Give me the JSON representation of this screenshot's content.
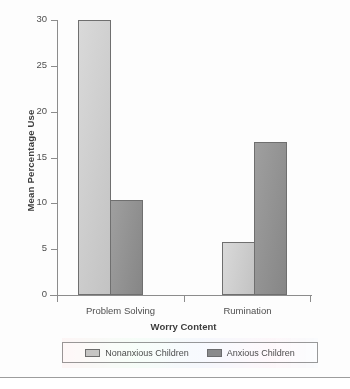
{
  "chart_data": {
    "type": "bar",
    "title": "",
    "xlabel": "Worry Content",
    "ylabel": "Mean Percentage Use",
    "categories": [
      "Problem Solving",
      "Rumination"
    ],
    "series": [
      {
        "name": "Nonanxious Children",
        "values": [
          30.0,
          5.8
        ],
        "color": "#c9c9c9"
      },
      {
        "name": "Anxious Children",
        "values": [
          10.4,
          16.7
        ],
        "color": "#8d8d8d"
      }
    ],
    "ylim": [
      0,
      30
    ],
    "yticks": [
      0,
      5,
      10,
      15,
      20,
      25,
      30
    ],
    "ytick_labels": [
      "0",
      "5",
      "10",
      "15",
      "20",
      "25",
      "30"
    ],
    "grid": false,
    "legend_position": "bottom"
  },
  "legend": {
    "entries": [
      {
        "label": "Nonanxious Children",
        "swatch": "light"
      },
      {
        "label": "Anxious Children",
        "swatch": "dark"
      }
    ]
  }
}
